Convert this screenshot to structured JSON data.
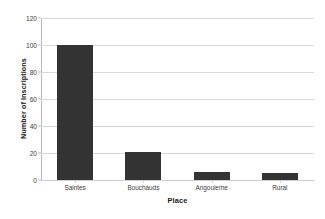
{
  "chart_data": {
    "type": "bar",
    "title": "",
    "xlabel": "Place",
    "ylabel": "Number of Inscriptions",
    "categories": [
      "Saintes",
      "Bouchauds",
      "Angouleme",
      "Rural"
    ],
    "values": [
      100,
      21,
      6,
      5
    ],
    "ylim": [
      0,
      120
    ],
    "yticks": [
      0,
      20,
      40,
      60,
      80,
      100,
      120
    ],
    "ytick_labels": [
      "0",
      "20",
      "40",
      "60",
      "80",
      "100",
      "120"
    ],
    "grid": "horizontal",
    "legend": "none",
    "bar_color": "#333333",
    "gridline_color": "#d7d7d7",
    "axis_color": "#b9b9b9",
    "background": "#ffffff"
  }
}
